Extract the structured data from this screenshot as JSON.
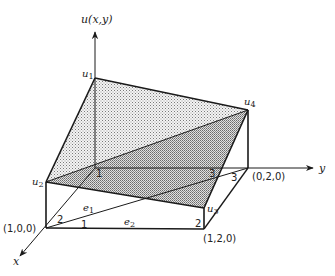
{
  "figure": {
    "axes": {
      "u_label": "u(x,y)",
      "x_label": "x",
      "y_label": "y"
    },
    "nodal_values": {
      "u1": "u",
      "u1_sub": "1",
      "u2": "u",
      "u2_sub": "2",
      "u3": "u",
      "u3_sub": "3",
      "u4": "u",
      "u4_sub": "4"
    },
    "points": {
      "p100": "(1,0,0)",
      "p020": "(0,2,0)",
      "p120": "(1,2,0)"
    },
    "elements": {
      "e1": "e",
      "e1_sub": "1",
      "e2": "e",
      "e2_sub": "2"
    },
    "local_node_numbers": {
      "origin_1": "1",
      "e1_node2": "2",
      "e2_node1": "1",
      "top_3": "3",
      "mid_3": "3",
      "e2_node2": "2"
    },
    "colors": {
      "line": "#1a1a1a",
      "shade_light": "#c8c8c8",
      "shade_dark": "#a8a8a8"
    }
  }
}
